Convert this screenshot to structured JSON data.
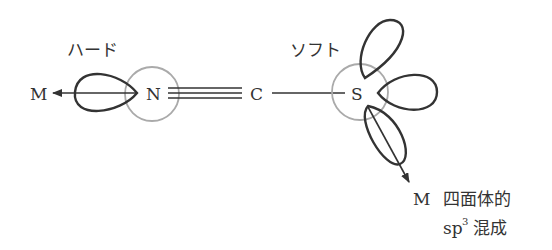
{
  "diagram": {
    "colors": {
      "stroke": "#333333",
      "atom_circle": "#aaaaaa",
      "background": "#ffffff"
    },
    "left": {
      "label": "ハード",
      "metal": "M",
      "atom": "N",
      "bond_partner": "C",
      "bond_type": "triple"
    },
    "right": {
      "label": "ソフト",
      "atom": "S",
      "metal": "M",
      "bond_type": "single",
      "description_line1": "四面体的",
      "description_line2_base": "sp",
      "description_line2_sup": "3",
      "description_line2_rest": "混成"
    }
  }
}
